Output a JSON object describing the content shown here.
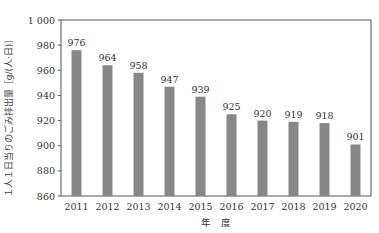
{
  "chart_data": {
    "type": "bar",
    "title": "",
    "xlabel": "年　度",
    "ylabel": "１人１日当りのごみ排出量［g/(人·日)］",
    "categories": [
      "2011",
      "2012",
      "2013",
      "2014",
      "2015",
      "2016",
      "2017",
      "2018",
      "2019",
      "2020"
    ],
    "values": [
      976,
      964,
      958,
      947,
      939,
      925,
      920,
      919,
      918,
      901
    ],
    "ylim": [
      860,
      1000
    ],
    "yticks": [
      860,
      880,
      900,
      920,
      940,
      960,
      980,
      1000
    ],
    "ytick_labels": [
      "860",
      "880",
      "900",
      "920",
      "940",
      "960",
      "980",
      "1 000"
    ],
    "grid": false,
    "bar_color": "#878787",
    "data_labels": true
  }
}
